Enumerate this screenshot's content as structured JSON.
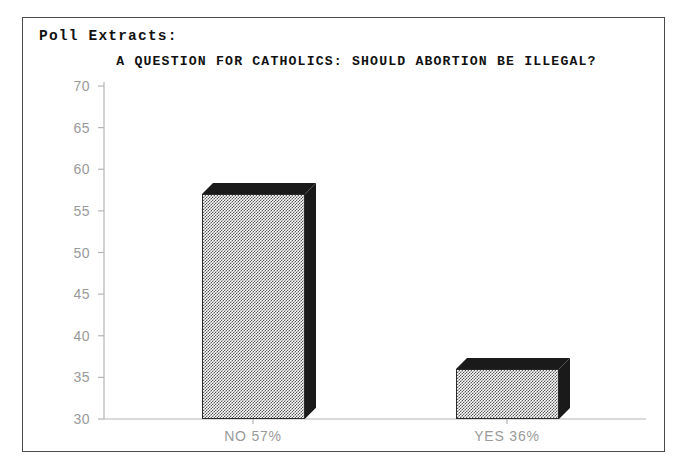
{
  "document": {
    "header_label": "Poll Extracts:"
  },
  "chart_data": {
    "type": "bar",
    "title": "A QUESTION FOR CATHOLICS: SHOULD ABORTION BE ILLEGAL?",
    "xlabel": "",
    "ylabel": "",
    "categories": [
      "NO 57%",
      "YES 36%"
    ],
    "values": [
      57,
      36
    ],
    "ylim": [
      30,
      70
    ],
    "yticks": [
      30,
      35,
      40,
      45,
      50,
      55,
      60,
      65,
      70
    ],
    "ytick_labels": [
      "30",
      "35",
      "40",
      "45",
      "50",
      "55",
      "60",
      "65",
      "70"
    ],
    "grid": false,
    "legend": null,
    "style": "3d-bar",
    "colors": {
      "bar_face": "#b0b0b0",
      "bar_shade": "#1a1a1a",
      "axis": "#b5b5b5",
      "tick_text": "#9a9a9a",
      "title_text": "#111111",
      "frame": "#4a4a4a",
      "background": "#ffffff"
    }
  }
}
